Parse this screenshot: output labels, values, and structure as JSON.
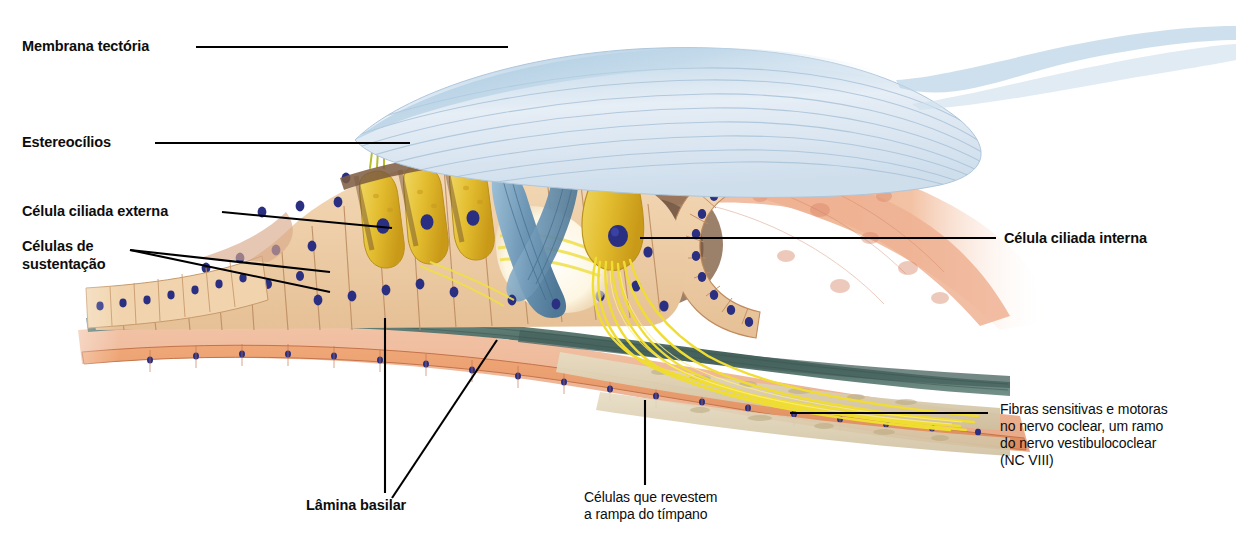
{
  "figure": {
    "background": "#ffffff"
  },
  "labels": {
    "membrana_tectoria": "Membrana tectória",
    "estereocilios": "Estereocílios",
    "celula_ciliada_externa": "Célula ciliada externa",
    "celulas_de_sustentacao": "Células de\nsustentação",
    "celula_ciliada_interna": "Célula ciliada interna",
    "fibras_nervo": "Fibras sensitivas e motoras\nno nervo coclear, um ramo\ndo nervo vestibulococlear\n(NC VIII)",
    "lamina_basilar": "Lâmina basilar",
    "celulas_rampa": "Células que revestem\na rampa do tímpano"
  },
  "colors": {
    "tectorial_membrane": "#dde7f2",
    "tectorial_shadow": "#9dbdd8",
    "hair_cell_yellow": "#e8c53c",
    "hair_cell_yellow_dark": "#c79a1e",
    "supporting_cell_tan": "#edcba4",
    "supporting_cell_line": "#b98a5e",
    "nucleus_blue": "#2a2f82",
    "pillar_blue": "#6e9cbe",
    "nerve_fiber_yellow": "#f2e23a",
    "basilar_band_teal": "#5d7d77",
    "connective_pink": "#f0b69a",
    "epithelium_orange": "#e89a6e",
    "bone_cream": "#ded3b8",
    "tunnel_brown": "#7c5a43",
    "leader_line": "#000000"
  },
  "structures": [
    {
      "name": "tectorial-membrane",
      "note": "pale blue striated flap over hair cells"
    },
    {
      "name": "stereocilia",
      "note": "small yellow-green tufts at hair cell apex"
    },
    {
      "name": "outer-hair-cells",
      "note": "row of elongated yellow cells, blue nuclei"
    },
    {
      "name": "inner-hair-cell",
      "note": "pear-shaped yellow cell, large blue nucleus"
    },
    {
      "name": "supporting-cells",
      "note": "tan columnar cells with blue nuclei"
    },
    {
      "name": "pillar-cells-tunnel",
      "note": "blue pillar cells forming tunnel of Corti"
    },
    {
      "name": "basilar-membrane",
      "note": "teal fibrous band under organ of Corti"
    },
    {
      "name": "cochlear-nerve-fibers",
      "note": "yellow fiber bundle descending right"
    },
    {
      "name": "spiral-limbus-lumen",
      "note": "curved columnar cell row around white lumen"
    },
    {
      "name": "scala-tympani-lining",
      "note": "thin orange epithelium with blue nuclei"
    }
  ]
}
